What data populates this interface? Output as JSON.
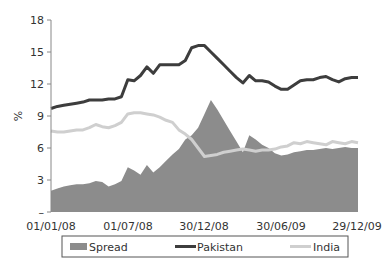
{
  "chart_data": {
    "type": "line",
    "title": "",
    "xlabel": "",
    "ylabel": "%",
    "ylim": [
      0,
      18
    ],
    "yticks": [
      0,
      3,
      6,
      9,
      12,
      15,
      18
    ],
    "ytick_labels": [
      "–",
      "3",
      "6",
      "9",
      "12",
      "15",
      "18"
    ],
    "xtick_labels": [
      "01/01/08",
      "01/07/08",
      "30/12/08",
      "30/06/09",
      "29/12/09"
    ],
    "grid": false,
    "legend_position": "bottom",
    "x": [
      0,
      1,
      2,
      3,
      4,
      5,
      6,
      7,
      8,
      9,
      10,
      11,
      12,
      13,
      14,
      15,
      16,
      17,
      18,
      19,
      20,
      21,
      22,
      23,
      24,
      25,
      26,
      27,
      28,
      29,
      30,
      31,
      32,
      33,
      34,
      35,
      36,
      37,
      38,
      39,
      40,
      41,
      42,
      43,
      44,
      45,
      46,
      47,
      48
    ],
    "series": [
      {
        "name": "Spread",
        "style": "area",
        "color": "#8c8c8c",
        "values": [
          2.0,
          2.2,
          2.4,
          2.5,
          2.6,
          2.6,
          2.7,
          2.9,
          2.8,
          2.4,
          2.6,
          2.9,
          4.2,
          3.9,
          3.5,
          4.4,
          3.7,
          4.2,
          4.8,
          5.4,
          5.9,
          6.8,
          7.2,
          7.9,
          9.2,
          10.5,
          9.6,
          8.6,
          7.6,
          6.6,
          5.6,
          7.2,
          6.8,
          6.3,
          6.0,
          5.5,
          5.3,
          5.4,
          5.6,
          5.7,
          5.8,
          5.8,
          5.9,
          6.0,
          5.9,
          6.0,
          6.1,
          6.0,
          6.0
        ]
      },
      {
        "name": "Pakistan",
        "style": "line",
        "color": "#3d3d3d",
        "values": [
          9.7,
          9.9,
          10.0,
          10.1,
          10.2,
          10.3,
          10.5,
          10.5,
          10.5,
          10.6,
          10.6,
          10.8,
          12.4,
          12.3,
          12.8,
          13.6,
          13.0,
          13.8,
          13.8,
          13.8,
          13.8,
          14.2,
          15.4,
          15.6,
          15.6,
          15.0,
          14.4,
          13.8,
          13.2,
          12.6,
          12.1,
          12.8,
          12.3,
          12.3,
          12.2,
          11.8,
          11.5,
          11.5,
          11.9,
          12.3,
          12.4,
          12.4,
          12.6,
          12.7,
          12.4,
          12.2,
          12.5,
          12.6,
          12.6
        ]
      },
      {
        "name": "India",
        "style": "line",
        "color": "#cfcfcf",
        "values": [
          7.6,
          7.5,
          7.5,
          7.6,
          7.7,
          7.7,
          7.9,
          8.2,
          8.0,
          7.9,
          8.1,
          8.4,
          9.2,
          9.3,
          9.3,
          9.2,
          9.1,
          8.9,
          8.6,
          8.4,
          7.7,
          7.3,
          6.8,
          6.0,
          5.2,
          5.3,
          5.4,
          5.6,
          5.7,
          5.8,
          5.9,
          5.8,
          5.7,
          5.8,
          5.8,
          5.9,
          6.1,
          6.2,
          6.5,
          6.4,
          6.6,
          6.5,
          6.4,
          6.3,
          6.6,
          6.5,
          6.4,
          6.6,
          6.5
        ]
      }
    ]
  },
  "legend": {
    "items": [
      {
        "label": "Spread",
        "color": "#8c8c8c",
        "style": "area"
      },
      {
        "label": "Pakistan",
        "color": "#3d3d3d",
        "style": "line"
      },
      {
        "label": "India",
        "color": "#cfcfcf",
        "style": "line"
      }
    ]
  }
}
